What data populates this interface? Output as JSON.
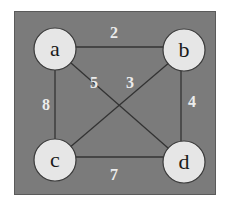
{
  "graph": {
    "colors": {
      "background": "#7b7b7b",
      "node_fill": "#e6e6e6",
      "node_stroke": "#3a3a3a",
      "edge": "#333333",
      "edge_label": "#ececec"
    },
    "nodes": [
      {
        "id": "a",
        "label": "a",
        "x": 55,
        "y": 49
      },
      {
        "id": "b",
        "label": "b",
        "x": 184,
        "y": 50
      },
      {
        "id": "c",
        "label": "c",
        "x": 55,
        "y": 160
      },
      {
        "id": "d",
        "label": "d",
        "x": 184,
        "y": 162
      }
    ],
    "edges": [
      {
        "from": "a",
        "to": "b",
        "weight": "2"
      },
      {
        "from": "a",
        "to": "c",
        "weight": "8"
      },
      {
        "from": "a",
        "to": "d",
        "weight": "5"
      },
      {
        "from": "b",
        "to": "c",
        "weight": "3"
      },
      {
        "from": "b",
        "to": "d",
        "weight": "4"
      },
      {
        "from": "c",
        "to": "d",
        "weight": "7"
      }
    ]
  }
}
